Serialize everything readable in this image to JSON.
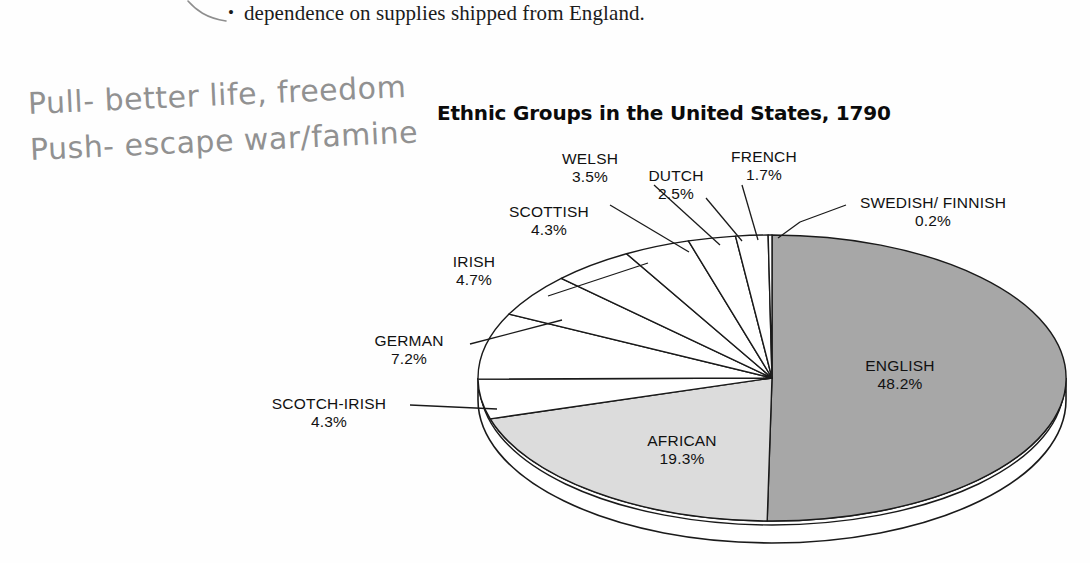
{
  "document": {
    "body_text": {
      "bullet_glyph": "•",
      "text": "dependence on supplies shipped from England."
    },
    "annotations": [
      {
        "id": "pull-note",
        "text": "Pull- better life, freedom"
      },
      {
        "id": "push-note",
        "text": "Push- escape war/famine"
      }
    ]
  },
  "chart_data": {
    "type": "pie",
    "title": "Ethnic Groups in the United States, 1790",
    "subtitle": "",
    "xlabel": "",
    "ylabel": "",
    "legend": "none",
    "grid": false,
    "value_unit": "%",
    "categories": [
      "ENGLISH",
      "AFRICAN",
      "SCOTCH-IRISH",
      "GERMAN",
      "IRISH",
      "SCOTTISH",
      "WELSH",
      "DUTCH",
      "FRENCH",
      "SWEDISH/ FINNISH"
    ],
    "values": [
      48.2,
      19.3,
      4.3,
      7.2,
      4.7,
      4.3,
      3.5,
      2.5,
      1.7,
      0.2
    ],
    "slices": [
      {
        "label": "ENGLISH",
        "value": 48.2,
        "value_text": "48.2%",
        "fill": "#a7a7a7",
        "label_position": "inside"
      },
      {
        "label": "AFRICAN",
        "value": 19.3,
        "value_text": "19.3%",
        "fill": "#dcdcdc",
        "label_position": "inside"
      },
      {
        "label": "SCOTCH-IRISH",
        "value": 4.3,
        "value_text": "4.3%",
        "fill": "#ffffff",
        "label_position": "outside"
      },
      {
        "label": "GERMAN",
        "value": 7.2,
        "value_text": "7.2%",
        "fill": "#ffffff",
        "label_position": "outside"
      },
      {
        "label": "IRISH",
        "value": 4.7,
        "value_text": "4.7%",
        "fill": "#ffffff",
        "label_position": "outside"
      },
      {
        "label": "SCOTTISH",
        "value": 4.3,
        "value_text": "4.3%",
        "fill": "#ffffff",
        "label_position": "outside"
      },
      {
        "label": "WELSH",
        "value": 3.5,
        "value_text": "3.5%",
        "fill": "#ffffff",
        "label_position": "outside"
      },
      {
        "label": "DUTCH",
        "value": 2.5,
        "value_text": "2.5%",
        "fill": "#ffffff",
        "label_position": "outside"
      },
      {
        "label": "FRENCH",
        "value": 1.7,
        "value_text": "1.7%",
        "fill": "#ffffff",
        "label_position": "outside"
      },
      {
        "label": "SWEDISH/ FINNISH",
        "value": 0.2,
        "value_text": "0.2%",
        "fill": "#ffffff",
        "label_position": "outside"
      }
    ]
  },
  "colors": {
    "english_slice": "#a7a7a7",
    "african_slice": "#dcdcdc",
    "other_slices": "#ffffff",
    "outline": "#1a1a1a",
    "text": "#111111",
    "handwriting": "#8c8c8c",
    "page_background": "#fefefe"
  }
}
